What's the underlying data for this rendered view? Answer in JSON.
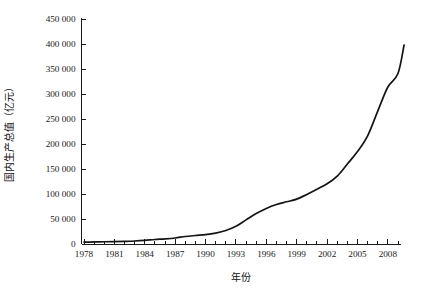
{
  "chart_data": {
    "type": "line",
    "title": "",
    "xlabel": "年份",
    "ylabel": "国内生产总值（亿元）",
    "xlim": [
      1978,
      2009
    ],
    "ylim": [
      0,
      450000
    ],
    "grid": false,
    "legend": null,
    "x_tick_labels": [
      "1978",
      "1981",
      "1984",
      "1987",
      "1990",
      "1993",
      "1996",
      "1999",
      "2002",
      "2005",
      "2008"
    ],
    "x_tick_values": [
      1978,
      1981,
      1984,
      1987,
      1990,
      1993,
      1996,
      1999,
      2002,
      2005,
      2008
    ],
    "x_minor_ticks_every": 1,
    "y_tick_labels": [
      "0",
      "50 000",
      "100 000",
      "150 000",
      "200 000",
      "250 000",
      "300 000",
      "350 000",
      "400 000",
      "450 000"
    ],
    "y_tick_values": [
      0,
      50000,
      100000,
      150000,
      200000,
      250000,
      300000,
      350000,
      400000,
      450000
    ],
    "x": [
      1978,
      1979,
      1980,
      1981,
      1982,
      1983,
      1984,
      1985,
      1986,
      1987,
      1988,
      1989,
      1990,
      1991,
      1992,
      1993,
      1994,
      1995,
      1996,
      1997,
      1998,
      1999,
      2000,
      2001,
      2002,
      2003,
      2004,
      2005,
      2006,
      2007,
      2008,
      2009
    ],
    "values": [
      3645,
      4063,
      4546,
      4892,
      5323,
      5963,
      7208,
      9016,
      10275,
      12059,
      15043,
      16992,
      18668,
      21782,
      26923,
      35334,
      48198,
      60794,
      71177,
      78973,
      84402,
      89677,
      99215,
      109655,
      120333,
      135823,
      159878,
      184937,
      216314,
      265810,
      314045,
      340903
    ],
    "last_point": {
      "x": 2009.6,
      "y": 398000
    },
    "line_color": "#141414",
    "background_color": "#ffffff",
    "axis_color": "#1a1a1a"
  }
}
